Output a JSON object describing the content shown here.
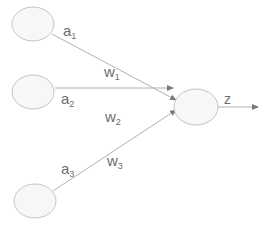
{
  "diagram": {
    "title": "",
    "inputs": [
      {
        "label": "a",
        "sub": "1",
        "weight": "w",
        "weight_sub": "1"
      },
      {
        "label": "a",
        "sub": "2",
        "weight": "w",
        "weight_sub": "2"
      },
      {
        "label": "a",
        "sub": "3",
        "weight": "w",
        "weight_sub": "3"
      }
    ],
    "output": {
      "label": "z"
    },
    "colors": {
      "stroke": "#c8c8c8",
      "fill": "#f7f7f7",
      "line": "#a8a8a8",
      "text": "#6e6e6e"
    }
  }
}
